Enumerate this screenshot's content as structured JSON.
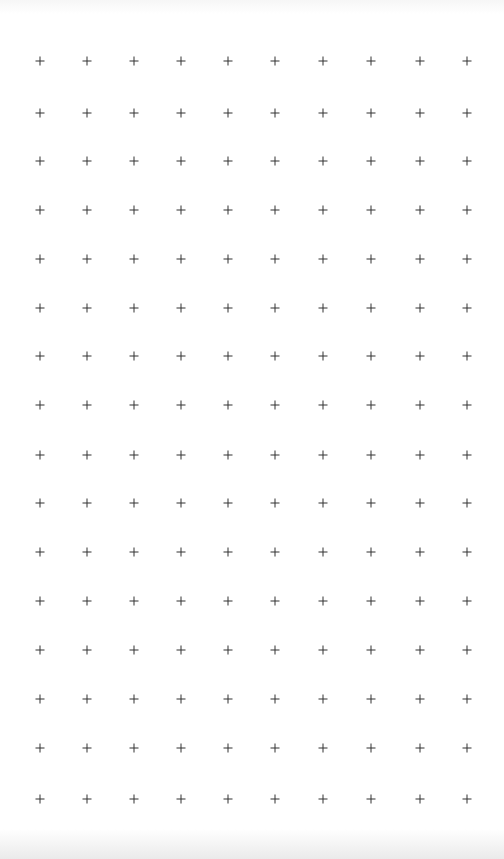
{
  "grid": {
    "marker_icon": "plus-icon",
    "marker_color": "#333333",
    "background": "#ffffff",
    "columns_x": [
      40,
      87,
      134,
      181,
      228,
      275,
      323,
      371,
      420,
      467
    ],
    "rows_y": [
      61,
      113,
      161,
      210,
      259,
      308,
      356,
      405,
      455,
      503,
      552,
      601,
      650,
      699,
      748,
      799
    ],
    "column_count": 10,
    "row_count": 16
  }
}
